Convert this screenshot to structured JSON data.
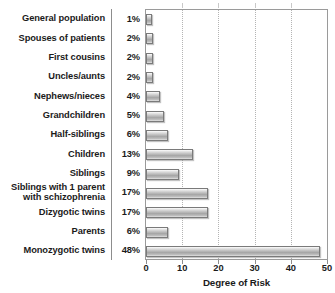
{
  "chart_data": {
    "type": "bar",
    "orientation": "horizontal",
    "title": "",
    "xlabel": "Degree of Risk",
    "ylabel": "",
    "xlim": [
      0,
      50
    ],
    "xticks": [
      0,
      10,
      20,
      30,
      40,
      50
    ],
    "grid": "vertical-dotted",
    "legend": "none",
    "value_suffix": "%",
    "categories": [
      "General population",
      "Spouses of patients",
      "First cousins",
      "Uncles/aunts",
      "Nephews/nieces",
      "Grandchildren",
      "Half-siblings",
      "Children",
      "Siblings",
      "Siblings with 1 parent\nwith schizophrenia",
      "Dizygotic twins",
      "Parents",
      "Monozygotic twins"
    ],
    "values": [
      1,
      2,
      2,
      2,
      4,
      5,
      6,
      13,
      9,
      17,
      17,
      6,
      48
    ],
    "value_labels": [
      "1%",
      "2%",
      "2%",
      "2%",
      "4%",
      "5%",
      "6%",
      "13%",
      "9%",
      "17%",
      "17%",
      "6%",
      "48%"
    ],
    "series": [
      {
        "name": "Degree of Risk",
        "values": [
          1,
          2,
          2,
          2,
          4,
          5,
          6,
          13,
          9,
          17,
          17,
          6,
          48
        ]
      }
    ],
    "colors": {
      "bar_fill_light": "#fdfdfd",
      "bar_fill_mid": "#a6a6a6",
      "bar_border": "#7a7a7a",
      "gridline": "#b4b4b4",
      "axis": "#9a9a9a",
      "text": "#1b1b1b",
      "background": "#ffffff"
    }
  }
}
